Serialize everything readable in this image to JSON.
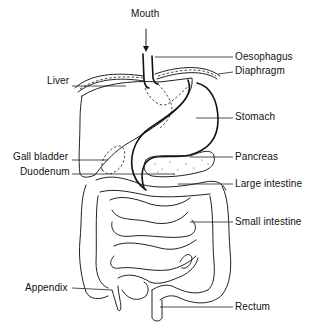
{
  "diagram": {
    "labels": {
      "mouth": "Mouth",
      "oesophagus": "Oesophagus",
      "diaphragm": "Diaphragm",
      "liver": "Liver",
      "stomach": "Stomach",
      "gall_bladder": "Gall bladder",
      "pancreas": "Pancreas",
      "duodenum": "Duodenum",
      "large_intestine": "Large intestine",
      "small_intestine": "Small intestine",
      "appendix": "Appendix",
      "rectum": "Rectum"
    },
    "colors": {
      "ink": "#222222",
      "background": "#ffffff"
    }
  }
}
